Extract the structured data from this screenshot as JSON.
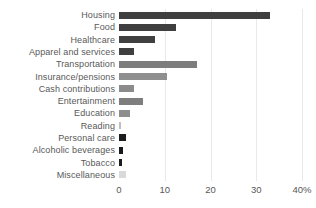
{
  "chart_data": {
    "type": "bar",
    "orientation": "horizontal",
    "title": "",
    "xlabel": "",
    "ylabel": "",
    "categories": [
      "Housing",
      "Food",
      "Healthcare",
      "Apparel and services",
      "Transportation",
      "Insurance/pensions",
      "Cash contributions",
      "Entertainment",
      "Education",
      "Reading",
      "Personal care",
      "Alcoholic beverages",
      "Tobacco",
      "Miscellaneous"
    ],
    "values": [
      33,
      12.5,
      7.9,
      3.3,
      17.1,
      10.5,
      3.3,
      5.2,
      2.5,
      0.4,
      1.5,
      0.9,
      0.7,
      1.5
    ],
    "bar_colors": [
      "#3f3f3f",
      "#3f3f3f",
      "#404040",
      "#3f3f3f",
      "#7d7d7d",
      "#8f8f8f",
      "#8b8b8b",
      "#7e7e7e",
      "#8e8e8e",
      "#bfbfbf",
      "#1c1c1c",
      "#191919",
      "#1c1c1c",
      "#d9d9d9"
    ],
    "xlim": [
      0,
      40
    ],
    "x_ticks": [
      {
        "value": 0,
        "label": "0"
      },
      {
        "value": 10,
        "label": "10"
      },
      {
        "value": 20,
        "label": "20"
      },
      {
        "value": 30,
        "label": "30"
      },
      {
        "value": 40,
        "label": "40%"
      }
    ],
    "grid": "vertical",
    "gridline_color": "#e9e9e9",
    "text_color": "#595959",
    "background": "#ffffff",
    "legend": "none"
  }
}
